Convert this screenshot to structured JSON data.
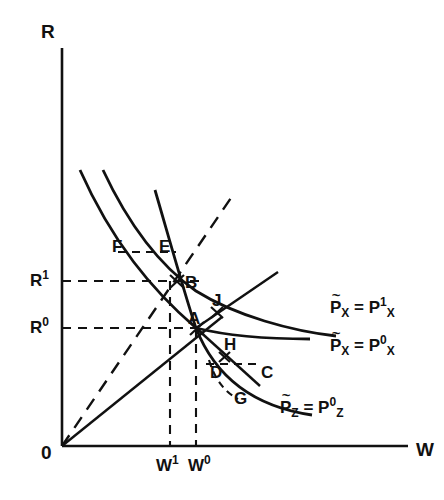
{
  "figure": {
    "type": "economic-diagram",
    "background": "#ffffff",
    "ink": "#111111"
  },
  "axes": {
    "y_label": "R",
    "x_label": "W",
    "origin_label": "0",
    "y_axis": {
      "x": 62,
      "y_top": 48,
      "y_bottom": 446
    },
    "x_axis": {
      "y": 446,
      "x_left": 62,
      "x_right": 408
    }
  },
  "ticks": {
    "y": [
      {
        "label": "R",
        "sup": "1",
        "value_y": 281,
        "dash_to_x": 200
      },
      {
        "label": "R",
        "sup": "0",
        "value_y": 328,
        "dash_to_x": 205
      }
    ],
    "x": [
      {
        "label": "W",
        "sup": "1",
        "value_x": 170,
        "dash_to_y": 281
      },
      {
        "label": "W",
        "sup": "0",
        "value_x": 196,
        "dash_to_y": 328
      }
    ]
  },
  "points": [
    {
      "name": "F",
      "x": 118,
      "y": 246,
      "marker": false
    },
    {
      "name": "E",
      "x": 164,
      "y": 246,
      "marker": false
    },
    {
      "name": "B",
      "x": 184,
      "y": 283,
      "marker": true,
      "mx": 176,
      "my": 281
    },
    {
      "name": "A",
      "x": 190,
      "y": 325,
      "marker": true,
      "mx": 196,
      "my": 328
    },
    {
      "name": "J",
      "x": 213,
      "y": 303,
      "marker": true,
      "mx": 216,
      "my": 312
    },
    {
      "name": "H",
      "x": 225,
      "y": 345,
      "marker": true,
      "mx": 224,
      "my": 357
    },
    {
      "name": "D",
      "x": 213,
      "y": 372,
      "marker": false
    },
    {
      "name": "C",
      "x": 262,
      "y": 372,
      "marker": false
    },
    {
      "name": "G",
      "x": 235,
      "y": 397,
      "marker": false
    }
  ],
  "curve_labels": [
    {
      "id": "px1",
      "base": "P",
      "tilde": true,
      "sub": "X",
      "eq": "=",
      "base2": "P",
      "sup2": "1",
      "sub2": "X",
      "x": 330,
      "y": 305
    },
    {
      "id": "px0",
      "base": "P",
      "tilde": true,
      "sub": "X",
      "eq": "=",
      "base2": "P",
      "sup2": "0",
      "sub2": "X",
      "x": 330,
      "y": 342
    },
    {
      "id": "pz0",
      "base": "P",
      "tilde": true,
      "sub": "Z",
      "eq": "=",
      "base2": "P",
      "sup2": "0",
      "sub2": "Z",
      "x": 280,
      "y": 404
    }
  ],
  "curves": {
    "x_iso_upper": {
      "style": "solid",
      "path": "M 80 170 C 110 235, 150 285, 196 328 C 240 336, 280 338, 310 339"
    },
    "x_iso_lower": {
      "style": "solid",
      "path": "M 103 170 C 130 230, 165 268, 196 290 C 235 312, 290 330, 336 336"
    },
    "z_iso": {
      "style": "solid",
      "path": "M 155 190 C 172 250, 186 300, 196 328 C 215 372, 250 405, 312 415"
    },
    "z_iso_dashed_arc": {
      "style": "dashed",
      "path": "M 209 361 C 214 380, 224 392, 236 398"
    },
    "ray_solid": {
      "style": "solid",
      "path": "M 62 446 L 220 318"
    },
    "ray_dashed": {
      "style": "dashed",
      "path": "M 62 446 L 235 192"
    },
    "ray_through_A": {
      "style": "solid",
      "path": "M 196 328 L 275 275"
    },
    "ray_down_right": {
      "style": "solid",
      "path": "M 196 328 L 258 384"
    }
  },
  "dashed_segments": {
    "EF": {
      "from_x": 118,
      "to_x": 176,
      "y": 252
    },
    "DC": {
      "from_x": 206,
      "to_x": 262,
      "y": 364
    }
  }
}
